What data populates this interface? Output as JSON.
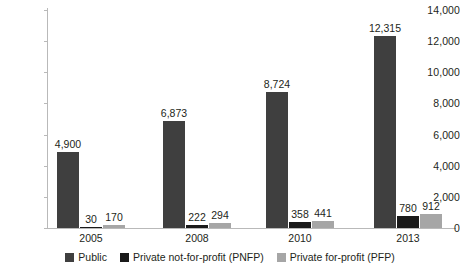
{
  "chart_data": {
    "type": "bar",
    "title": "",
    "subtitle": "",
    "xlabel": "",
    "ylabel": "",
    "categories": [
      "2005",
      "2008",
      "2010",
      "2013"
    ],
    "series": [
      {
        "name": "Public",
        "color": "#3f3f3f",
        "values": [
          4900,
          6873,
          8724,
          12315
        ],
        "labels": [
          "4,900",
          "6,873",
          "8,724",
          "12,315"
        ]
      },
      {
        "name": "Private not-for-profit (PNFP)",
        "color": "#1a1a1a",
        "values": [
          30,
          222,
          358,
          780
        ],
        "labels": [
          "30",
          "222",
          "358",
          "780"
        ]
      },
      {
        "name": "Private for-profit (PFP)",
        "color": "#a6a6a6",
        "values": [
          170,
          294,
          441,
          912
        ],
        "labels": [
          "170",
          "294",
          "441",
          "912"
        ]
      }
    ],
    "ylim": [
      0,
      14000
    ],
    "ytick_step": 2000,
    "ytick_labels": [
      "0",
      "2,000",
      "4,000",
      "6,000",
      "8,000",
      "10,000",
      "12,000",
      "14,000"
    ],
    "grid": false,
    "legend_position": "bottom"
  },
  "axis": {
    "y_ticks": [
      {
        "value": 14000,
        "label": "14,000"
      },
      {
        "value": 12000,
        "label": "12,000"
      },
      {
        "value": 10000,
        "label": "10,000"
      },
      {
        "value": 8000,
        "label": "8,000"
      },
      {
        "value": 6000,
        "label": "6,000"
      },
      {
        "value": 4000,
        "label": "4,000"
      },
      {
        "value": 2000,
        "label": "2,000"
      },
      {
        "value": 0,
        "label": "0"
      }
    ],
    "x_ticks": [
      "2005",
      "2008",
      "2010",
      "2013"
    ]
  },
  "legend": {
    "items": [
      {
        "label": "Public",
        "color": "#3f3f3f"
      },
      {
        "label": "Private not-for-profit (PNFP)",
        "color": "#1a1a1a"
      },
      {
        "label": "Private for-profit (PFP)",
        "color": "#a6a6a6"
      }
    ]
  }
}
